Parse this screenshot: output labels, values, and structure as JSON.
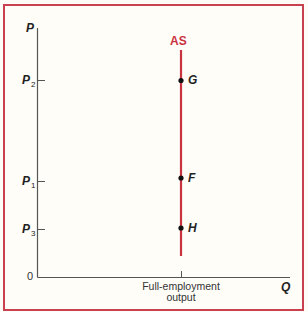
{
  "colors": {
    "frame": "#c9404f",
    "supply_curve": "#c9333f",
    "axes": "#555555",
    "text": "#222222",
    "background": "#fefdf8"
  },
  "axes": {
    "y_label": "P",
    "x_label": "Q",
    "origin_label": "0",
    "x_tick_label_line1": "Full-employment",
    "x_tick_label_line2": "output"
  },
  "y_ticks": [
    {
      "base": "P",
      "sub": "2"
    },
    {
      "base": "P",
      "sub": "1"
    },
    {
      "base": "P",
      "sub": "3"
    }
  ],
  "curve": {
    "label": "AS",
    "type": "vertical line"
  },
  "points": [
    {
      "label": "G",
      "price_level": "P2"
    },
    {
      "label": "F",
      "price_level": "P1"
    },
    {
      "label": "H",
      "price_level": "P3"
    }
  ]
}
